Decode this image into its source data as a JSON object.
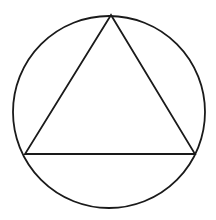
{
  "diagram": {
    "stroke_color": "#1a1a1a",
    "background": "#ffffff",
    "circle": {
      "cx": 109,
      "cy": 112,
      "r": 96
    },
    "triangle": {
      "vertices": [
        {
          "name": "top",
          "x": 111,
          "y": 15
        },
        {
          "name": "bottom-left",
          "x": 25,
          "y": 154
        },
        {
          "name": "bottom-right",
          "x": 195,
          "y": 154
        }
      ]
    }
  }
}
